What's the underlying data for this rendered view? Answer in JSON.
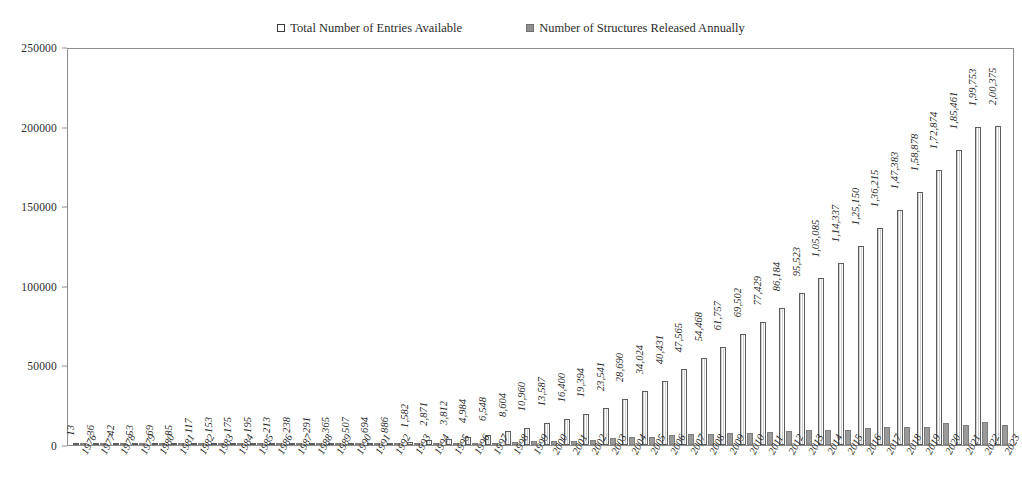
{
  "legend": {
    "position": "top-center",
    "entries": [
      {
        "label": "Total Number of Entries Available",
        "swatch": "hollow-outline-swatch",
        "color": "#ffffff"
      },
      {
        "label": "Number of Structures Released Annually",
        "swatch": "gray-filled-swatch",
        "color": "#9a9a9a"
      }
    ]
  },
  "axes": {
    "y_ticks": [
      "0",
      "50000",
      "100000",
      "150000",
      "200000",
      "250000"
    ],
    "y_min": 0,
    "y_max": 250000,
    "y_step": 50000
  },
  "chart_data": {
    "type": "bar",
    "title": "",
    "subtitle": "",
    "xlabel": "",
    "ylabel": "",
    "ylim": [
      0,
      250000
    ],
    "ytick_step": 50000,
    "grid": false,
    "legend_position": "top-center",
    "number_format": "indian-lakh-grouping",
    "categories": [
      "1976",
      "1977",
      "1978",
      "1979",
      "1980",
      "1981",
      "1982",
      "1983",
      "1984",
      "1985",
      "1986",
      "1987",
      "1988",
      "1989",
      "1990",
      "1991",
      "1992",
      "1993",
      "1994",
      "1995",
      "1996",
      "1997",
      "1998",
      "1999",
      "2000",
      "2001",
      "2002",
      "2003",
      "2004",
      "2005",
      "2006",
      "2007",
      "2008",
      "2009",
      "2010",
      "2011",
      "2012",
      "2013",
      "2014",
      "2015",
      "2016",
      "2017",
      "2018",
      "2019",
      "2020",
      "2021",
      "2022",
      "2023"
    ],
    "series": [
      {
        "name": "Total Number of Entries Available",
        "values": [
          13,
          36,
          42,
          53,
          69,
          85,
          117,
          153,
          175,
          195,
          213,
          238,
          291,
          365,
          507,
          694,
          886,
          1582,
          2871,
          3812,
          4984,
          6548,
          8604,
          10960,
          13587,
          16400,
          19394,
          23541,
          28690,
          34024,
          40431,
          47565,
          54468,
          61757,
          69502,
          77429,
          86184,
          95523,
          105085,
          114337,
          125150,
          136215,
          147383,
          158878,
          172874,
          185461,
          199753,
          200375
        ],
        "labels": [
          "13",
          "36",
          "42",
          "53",
          "69",
          "85",
          "117",
          "153",
          "175",
          "195",
          "213",
          "238",
          "291",
          "365",
          "507",
          "694",
          "886",
          "1,582",
          "2,871",
          "3,812",
          "4,984",
          "6,548",
          "8,604",
          "10,960",
          "13,587",
          "16,400",
          "19,394",
          "23,541",
          "28,690",
          "34,024",
          "40,431",
          "47,565",
          "54,468",
          "61,757",
          "69,502",
          "77,429",
          "86,184",
          "95,523",
          "1,05,085",
          "1,14,337",
          "1,25,150",
          "1,36,215",
          "1,47,383",
          "1,58,878",
          "1,72,874",
          "1,85,461",
          "1,99,753",
          "2,00,375"
        ]
      },
      {
        "name": "Number of Structures Released Annually",
        "values": [
          13,
          23,
          6,
          11,
          16,
          16,
          32,
          36,
          22,
          20,
          18,
          25,
          53,
          74,
          142,
          187,
          192,
          696,
          1289,
          941,
          1172,
          1564,
          2056,
          2356,
          2627,
          2813,
          2994,
          4147,
          5149,
          5334,
          6407,
          7134,
          6903,
          7289,
          7745,
          7927,
          8755,
          9339,
          9562,
          9252,
          10813,
          11065,
          11168,
          11495,
          13996,
          12587,
          14292,
          12622
        ],
        "labels": []
      }
    ]
  }
}
